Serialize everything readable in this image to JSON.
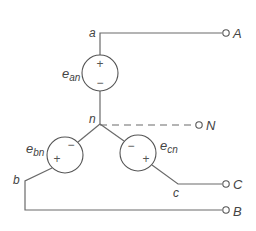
{
  "diagram": {
    "sources": [
      {
        "name": "e",
        "sub": "an",
        "plus": "+",
        "minus": "−"
      },
      {
        "name": "e",
        "sub": "bn",
        "plus": "+",
        "minus": "−"
      },
      {
        "name": "e",
        "sub": "cn",
        "plus": "+",
        "minus": "−"
      }
    ],
    "nodes": {
      "a": "a",
      "b": "b",
      "c": "c",
      "n": "n"
    },
    "terminals": {
      "A": "A",
      "B": "B",
      "C": "C",
      "N": "N"
    },
    "colors": {
      "wire": "#6a6a6a",
      "text": "#444444",
      "background": "#ffffff"
    }
  }
}
